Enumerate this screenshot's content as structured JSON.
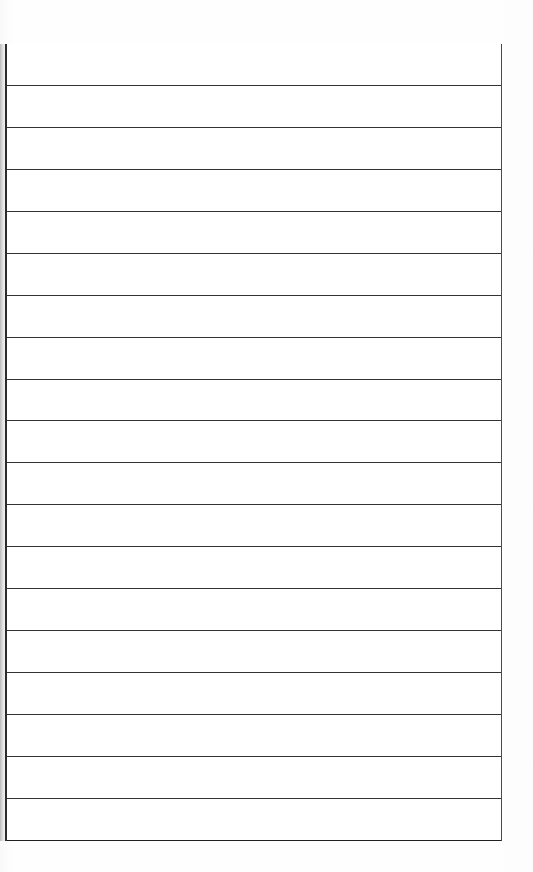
{
  "document": {
    "kind": "scanned-blank-ruled-table",
    "page_background_color": "#fdfdfd",
    "paper_color": "#ffffff",
    "rule_color": "#333333",
    "border_color": "#2b2b2b",
    "has_visible_text": false,
    "caption": ""
  },
  "table": {
    "name": "blank-ruled-grid",
    "column_count": 1,
    "row_count": 19,
    "left_px": 5,
    "top_px": 44,
    "width_px": 497,
    "height_px": 797,
    "row_height_px": 41.9,
    "has_top_border": false,
    "has_bottom_border": true,
    "has_left_border": true,
    "has_right_border": true,
    "headers": [
      ""
    ],
    "rows": [
      [
        ""
      ],
      [
        ""
      ],
      [
        ""
      ],
      [
        ""
      ],
      [
        ""
      ],
      [
        ""
      ],
      [
        ""
      ],
      [
        ""
      ],
      [
        ""
      ],
      [
        ""
      ],
      [
        ""
      ],
      [
        ""
      ],
      [
        ""
      ],
      [
        ""
      ],
      [
        ""
      ],
      [
        ""
      ],
      [
        ""
      ],
      [
        ""
      ],
      [
        ""
      ]
    ]
  }
}
